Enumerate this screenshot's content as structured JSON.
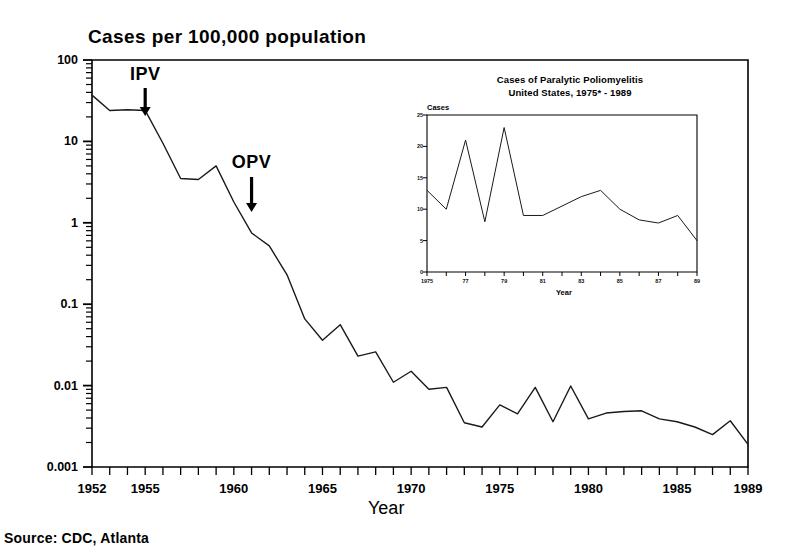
{
  "figure": {
    "main_title": "Cases per 100,000 population",
    "xaxis_title": "Year",
    "source": "Source: CDC, Atlanta",
    "annotations": [
      {
        "label": "IPV",
        "year": 1955,
        "note": "inactivated polio vaccine introduced"
      },
      {
        "label": "OPV",
        "year": 1961,
        "note": "oral polio vaccine introduced"
      }
    ]
  },
  "chart_data": {
    "type": "line",
    "title": "Cases per 100,000 population",
    "xlabel": "Year",
    "ylabel": "Cases per 100,000 population",
    "yscale": "log",
    "ylim": [
      0.001,
      100
    ],
    "xlim": [
      1952,
      1989
    ],
    "grid": false,
    "legend": null,
    "ytick_labels": [
      "100",
      "10",
      "1",
      "0.1",
      "0.01",
      "0.001"
    ],
    "ytick_values": [
      100,
      10,
      1,
      0.1,
      0.01,
      0.001
    ],
    "xtick_labels": [
      "1952",
      "1955",
      "1960",
      "1965",
      "1970",
      "1975",
      "1980",
      "1985",
      "1989"
    ],
    "xtick_values": [
      1952,
      1955,
      1960,
      1965,
      1970,
      1975,
      1980,
      1985,
      1989
    ],
    "x": [
      1952,
      1953,
      1954,
      1955,
      1956,
      1957,
      1958,
      1959,
      1960,
      1961,
      1962,
      1963,
      1964,
      1965,
      1966,
      1967,
      1968,
      1969,
      1970,
      1971,
      1972,
      1973,
      1974,
      1975,
      1976,
      1977,
      1978,
      1979,
      1980,
      1981,
      1982,
      1983,
      1984,
      1985,
      1986,
      1987,
      1988,
      1989
    ],
    "values": [
      37,
      24,
      24.5,
      24,
      9.5,
      3.5,
      3.4,
      5.0,
      1.8,
      0.75,
      0.52,
      0.23,
      0.066,
      0.036,
      0.056,
      0.023,
      0.026,
      0.011,
      0.015,
      0.009,
      0.0095,
      0.0035,
      0.0031,
      0.0058,
      0.0045,
      0.0095,
      0.0036,
      0.0099,
      0.0039,
      0.0046,
      0.0048,
      0.0049,
      0.0039,
      0.0036,
      0.0031,
      0.0025,
      0.0037,
      0.0019
    ],
    "inset": {
      "type": "line",
      "title_line1": "Cases of Paralytic Poliomyelitis",
      "title_line2": "United States, 1975* - 1989",
      "xlabel": "Year",
      "ylabel": "Cases",
      "ylim": [
        0,
        25
      ],
      "xlim": [
        1975,
        1989
      ],
      "ytick_labels": [
        "25",
        "20",
        "15",
        "10",
        "5",
        "0"
      ],
      "ytick_values": [
        25,
        20,
        15,
        10,
        5,
        0
      ],
      "xtick_labels": [
        "1975",
        "77",
        "79",
        "81",
        "83",
        "85",
        "87",
        "89"
      ],
      "xtick_values": [
        1975,
        1977,
        1979,
        1981,
        1983,
        1985,
        1987,
        1989
      ],
      "x": [
        1975,
        1976,
        1977,
        1978,
        1979,
        1980,
        1981,
        1982,
        1983,
        1984,
        1985,
        1986,
        1987,
        1988,
        1989
      ],
      "values": [
        13,
        10,
        21,
        8,
        23,
        9,
        9,
        10.5,
        12,
        13,
        10,
        8.3,
        7.8,
        9,
        5
      ]
    }
  }
}
